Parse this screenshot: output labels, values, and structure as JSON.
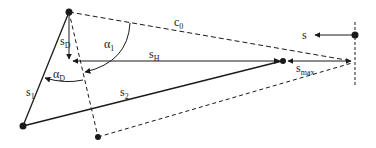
{
  "diagram": {
    "labels": {
      "c0": {
        "base": "c",
        "sub": "0"
      },
      "s": {
        "base": "s",
        "sub": ""
      },
      "sD": {
        "base": "s",
        "sub": "D"
      },
      "sH": {
        "base": "s",
        "sub": "H"
      },
      "smax": {
        "base": "s",
        "sub": "max"
      },
      "s1": {
        "base": "s",
        "sub": "1"
      },
      "s2": {
        "base": "s",
        "sub": "2"
      },
      "alpha1": {
        "base": "α",
        "sub": "1"
      },
      "alphaD": {
        "base": "α",
        "sub": "D"
      }
    },
    "colors": {
      "line": "#1a1a1a",
      "background": "#ffffff"
    }
  }
}
